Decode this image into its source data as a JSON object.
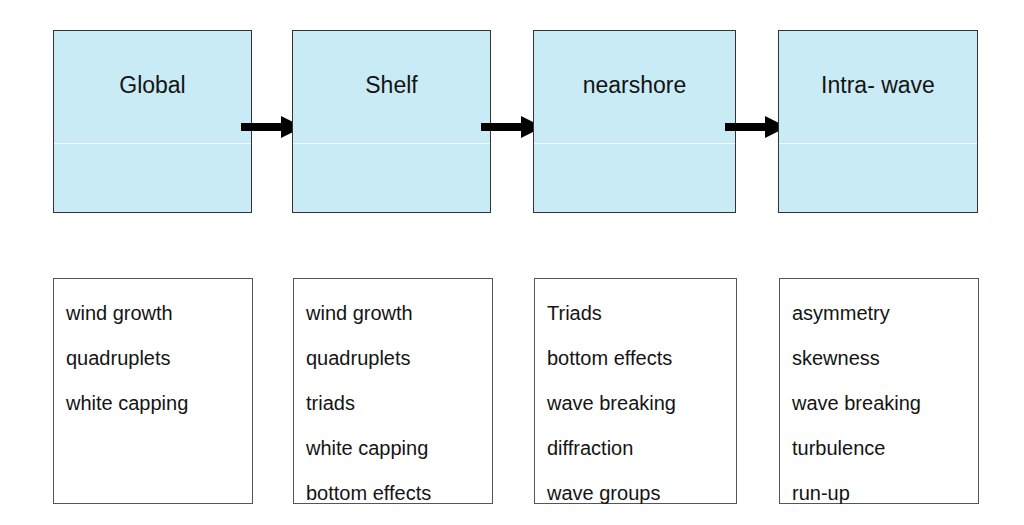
{
  "diagram": {
    "stages": [
      {
        "title": "Global"
      },
      {
        "title": "Shelf"
      },
      {
        "title": "nearshore"
      },
      {
        "title": "Intra- wave"
      }
    ],
    "processes": [
      {
        "items": [
          "wind growth",
          "quadruplets",
          "white capping"
        ]
      },
      {
        "items": [
          "wind growth",
          "quadruplets",
          "triads",
          "white capping",
          "bottom effects"
        ]
      },
      {
        "items": [
          "Triads",
          "bottom effects",
          "wave breaking",
          "diffraction",
          "wave groups"
        ]
      },
      {
        "items": [
          "asymmetry",
          "skewness",
          "wave breaking",
          "turbulence",
          "run-up"
        ]
      }
    ],
    "colors": {
      "stage_fill": "#c9ebf5",
      "arrow": "#000000",
      "border": "#333333"
    }
  }
}
